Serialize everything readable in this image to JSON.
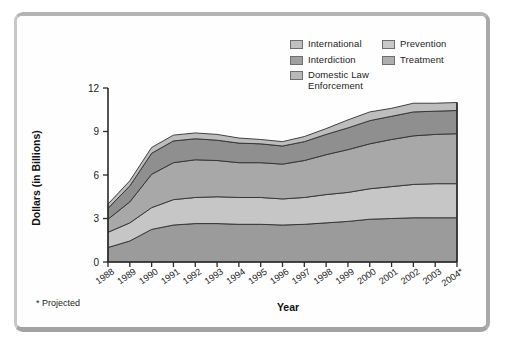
{
  "figure": {
    "y_axis_title": "Dollars (in Billions)",
    "x_axis_title": "Year",
    "footnote": "* Projected"
  },
  "legend": {
    "columns": [
      {
        "items": [
          {
            "label": "International",
            "color": "#c0c0c0",
            "name": "legend-international"
          },
          {
            "label": "Interdiction",
            "color": "#a0a0a0",
            "name": "legend-interdiction"
          },
          {
            "label": "Domestic Law\nEnforcement",
            "color": "#b8b8b8",
            "name": "legend-domestic-law-enforcement"
          }
        ]
      },
      {
        "items": [
          {
            "label": "Prevention",
            "color": "#c8c8c8",
            "name": "legend-prevention"
          },
          {
            "label": "Treatment",
            "color": "#aeaeae",
            "name": "legend-treatment"
          }
        ]
      }
    ]
  },
  "axes": {
    "y_ticks": [
      "0",
      "3",
      "6",
      "9",
      "12"
    ],
    "x_ticks": [
      "1988",
      "1989",
      "1990",
      "1991",
      "1992",
      "1993",
      "1994",
      "1995",
      "1996",
      "1997",
      "1998",
      "1999",
      "2000",
      "2001",
      "2002",
      "2003",
      "2004*"
    ]
  },
  "chart_data": {
    "type": "area",
    "title": "",
    "subtitle": "",
    "xlabel": "Year",
    "ylabel": "Dollars (in Billions)",
    "xlim": [
      1988,
      2004
    ],
    "ylim": [
      0,
      12
    ],
    "ytick_values": [
      0,
      3,
      6,
      9,
      12
    ],
    "grid": false,
    "stacked": true,
    "legend_position": "top-right",
    "annotations": [
      "* Projected"
    ],
    "x": [
      "1988",
      "1989",
      "1990",
      "1991",
      "1992",
      "1993",
      "1994",
      "1995",
      "1996",
      "1997",
      "1998",
      "1999",
      "2000",
      "2001",
      "2002",
      "2003",
      "2004*"
    ],
    "series": [
      {
        "name": "Domestic Law Enforcement",
        "color": "#9b9b9b",
        "stack_order": 1,
        "values": [
          1.0,
          1.45,
          2.25,
          2.55,
          2.65,
          2.65,
          2.6,
          2.6,
          2.55,
          2.6,
          2.7,
          2.8,
          2.95,
          3.0,
          3.05,
          3.05,
          3.05
        ]
      },
      {
        "name": "Treatment",
        "color": "#c6c6c6",
        "stack_order": 2,
        "values": [
          1.05,
          1.25,
          1.5,
          1.75,
          1.8,
          1.85,
          1.85,
          1.85,
          1.8,
          1.85,
          1.95,
          2.0,
          2.1,
          2.2,
          2.3,
          2.35,
          2.35
        ]
      },
      {
        "name": "Prevention",
        "color": "#a8a8a8",
        "stack_order": 3,
        "values": [
          0.9,
          1.45,
          2.3,
          2.55,
          2.6,
          2.5,
          2.4,
          2.4,
          2.4,
          2.55,
          2.75,
          2.95,
          3.1,
          3.25,
          3.35,
          3.4,
          3.45
        ]
      },
      {
        "name": "Interdiction",
        "color": "#8f8f8f",
        "stack_order": 4,
        "values": [
          0.75,
          1.1,
          1.45,
          1.5,
          1.45,
          1.4,
          1.35,
          1.3,
          1.25,
          1.3,
          1.4,
          1.5,
          1.6,
          1.6,
          1.65,
          1.6,
          1.6
        ]
      },
      {
        "name": "International",
        "color": "#bdbdbd",
        "stack_order": 5,
        "values": [
          0.3,
          0.35,
          0.4,
          0.4,
          0.4,
          0.4,
          0.35,
          0.3,
          0.3,
          0.35,
          0.4,
          0.55,
          0.6,
          0.55,
          0.6,
          0.55,
          0.55
        ]
      }
    ],
    "totals": [
      4.0,
      5.6,
      7.9,
      8.75,
      8.9,
      8.8,
      8.55,
      8.45,
      8.3,
      8.65,
      9.2,
      9.8,
      10.35,
      10.6,
      10.95,
      10.95,
      11.0
    ]
  }
}
